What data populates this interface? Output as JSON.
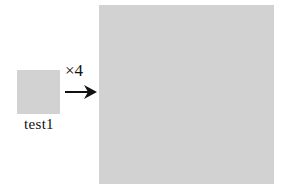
{
  "diagram": {
    "source": {
      "label": "test1",
      "fill_color": "#d2d2d2"
    },
    "transform": {
      "label": "×4",
      "arrow": "right-arrow-icon"
    },
    "result": {
      "fill_color": "#d2d2d2"
    }
  }
}
